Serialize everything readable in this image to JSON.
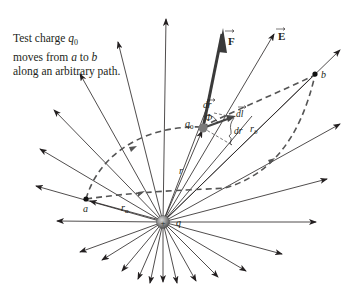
{
  "caption": {
    "line1_prefix": "Test charge ",
    "line1_var": "q",
    "line1_sub": "0",
    "line2_prefix": "moves from ",
    "line2_a": "a",
    "line2_mid": " to ",
    "line2_b": "b",
    "line3": "along an arbitrary path."
  },
  "labels": {
    "force": "F",
    "field": "E",
    "point_a": "a",
    "point_b": "b",
    "test_charge": "q",
    "test_charge_sub": "0",
    "source_charge": "q",
    "r": "r",
    "r_a": "r",
    "r_a_sub": "a",
    "r_b": "r",
    "r_b_sub": "b",
    "dr_vec": "dr",
    "phi": "Φ",
    "dl_vec": "dl",
    "dr": "dr",
    "plus": "+"
  },
  "colors": {
    "line": "#231f20",
    "force_arrow": "#3a3a3a",
    "charge_fill": "#8a8a8a",
    "dash": "#555555"
  }
}
